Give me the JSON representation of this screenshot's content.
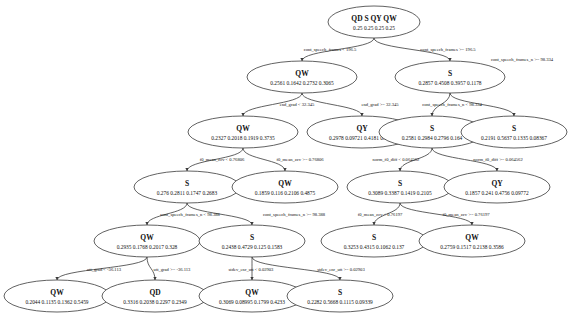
{
  "diagram": {
    "type": "decision-tree",
    "title": "",
    "node_shape": "ellipse",
    "class_order": [
      "QD",
      "S",
      "QY",
      "QW"
    ],
    "colors": {
      "stroke": "#3a3a3a",
      "fill": "#ffffff",
      "text": "#111111"
    },
    "nodes": [
      {
        "id": "n0",
        "label": "QD S QY QW",
        "values": "0.25 0.25 0.25 0.25",
        "cx": 374,
        "cy": 22,
        "rx": 46,
        "ry": 16
      },
      {
        "id": "n1",
        "label": "QW",
        "values": "0.2561 0.1642 0.2732 0.3065",
        "cx": 302,
        "cy": 77,
        "rx": 55,
        "ry": 16
      },
      {
        "id": "n2",
        "label": "S",
        "values": "0.2857 0.4508 0.3957 0.1178",
        "cx": 450,
        "cy": 77,
        "rx": 55,
        "ry": 16
      },
      {
        "id": "n3",
        "label": "QW",
        "values": "0.2327 0.2018 0.1919 0.3735",
        "cx": 243,
        "cy": 132,
        "rx": 55,
        "ry": 16
      },
      {
        "id": "n4",
        "label": "QY",
        "values": "0.2978 0.09721 0.4181 0.1869",
        "cx": 362,
        "cy": 132,
        "rx": 55,
        "ry": 16
      },
      {
        "id": "n5",
        "label": "S",
        "values": "0.2581 0.2984 0.2796 0.164",
        "cx": 432,
        "cy": 132,
        "rx": 53,
        "ry": 16
      },
      {
        "id": "n6",
        "label": "S",
        "values": "0.2191 0.5637 0.1335 0.08367",
        "cx": 514,
        "cy": 132,
        "rx": 53,
        "ry": 16
      },
      {
        "id": "n7",
        "label": "S",
        "values": "0.276 0.2811 0.1747 0.2683",
        "cx": 187,
        "cy": 187,
        "rx": 53,
        "ry": 16
      },
      {
        "id": "n8",
        "label": "QW",
        "values": "0.1859 0.116 0.2106 0.4875",
        "cx": 285,
        "cy": 187,
        "rx": 53,
        "ry": 16
      },
      {
        "id": "n9",
        "label": "S",
        "values": "0.3089 0.3387 0.1419 0.2105",
        "cx": 400,
        "cy": 187,
        "rx": 53,
        "ry": 16
      },
      {
        "id": "n10",
        "label": "QY",
        "values": "0.1857 0.241 0.4756 0.09772",
        "cx": 497,
        "cy": 187,
        "rx": 53,
        "ry": 16
      },
      {
        "id": "n11",
        "label": "QW",
        "values": "0.2935 0.1768 0.2017 0.328",
        "cx": 147,
        "cy": 241,
        "rx": 53,
        "ry": 16
      },
      {
        "id": "n12",
        "label": "S",
        "values": "0.2438 0.4729 0.125 0.1583",
        "cx": 252,
        "cy": 241,
        "rx": 53,
        "ry": 16
      },
      {
        "id": "n13",
        "label": "S",
        "values": "0.3253 0.4315 0.1062 0.137",
        "cx": 374,
        "cy": 241,
        "rx": 53,
        "ry": 16
      },
      {
        "id": "n14",
        "label": "QW",
        "values": "0.2759 0.1517 0.2138 0.3586",
        "cx": 472,
        "cy": 241,
        "rx": 53,
        "ry": 16
      },
      {
        "id": "n15",
        "label": "QW",
        "values": "0.2044 0.1135 0.1362 0.5459",
        "cx": 57,
        "cy": 296,
        "rx": 53,
        "ry": 16
      },
      {
        "id": "n16",
        "label": "QD",
        "values": "0.3316 0.2038 0.2297 0.2349",
        "cx": 155,
        "cy": 296,
        "rx": 53,
        "ry": 16
      },
      {
        "id": "n17",
        "label": "QW",
        "values": "0.3069 0.08995 0.1799 0.4233",
        "cx": 252,
        "cy": 296,
        "rx": 53,
        "ry": 16
      },
      {
        "id": "n18",
        "label": "S",
        "values": "0.2282 0.5668 0.1115 0.09339",
        "cx": 340,
        "cy": 296,
        "rx": 53,
        "ry": 16
      }
    ],
    "edges": [
      {
        "from": "n0",
        "to": "n1",
        "label": "cont_speech_frames < 196.5",
        "lx": 330,
        "ly": 51
      },
      {
        "from": "n0",
        "to": "n2",
        "label": "cont_speech_frames >= 196.5",
        "lx": 448,
        "ly": 51
      },
      {
        "from": "n1",
        "to": "n3",
        "label": "end_grad < 32.345",
        "lx": 297,
        "ly": 106
      },
      {
        "from": "n1",
        "to": "n4",
        "label": "end_grad >= 32.345",
        "lx": 380,
        "ly": 106
      },
      {
        "from": "n2",
        "to": "n5",
        "label": "cont_speech_frames_n < 98.334",
        "lx": 452,
        "ly": 106
      },
      {
        "from": "n2",
        "to": "n6",
        "label": "cont_speech_frames_n >= 98.334",
        "lx": 522,
        "ly": 61
      },
      {
        "from": "n3",
        "to": "n7",
        "label": "f0_mean_zcv < 0.76806",
        "lx": 222,
        "ly": 161
      },
      {
        "from": "n3",
        "to": "n8",
        "label": "f0_mean_zcv >= 0.76806",
        "lx": 300,
        "ly": 161
      },
      {
        "from": "n5",
        "to": "n9",
        "label": "norm_f0_diff < 0.064562",
        "lx": 396,
        "ly": 161
      },
      {
        "from": "n5",
        "to": "n10",
        "label": "norm_f0_diff >= 0.064562",
        "lx": 498,
        "ly": 161
      },
      {
        "from": "n7",
        "to": "n11",
        "label": "cont_speech_frames_n < 98.388",
        "lx": 190,
        "ly": 216
      },
      {
        "from": "n7",
        "to": "n12",
        "label": "cont_speech_frames_n >= 98.388",
        "lx": 294,
        "ly": 216
      },
      {
        "from": "n9",
        "to": "n13",
        "label": "f0_mean_zcv < 0.76197",
        "lx": 380,
        "ly": 216
      },
      {
        "from": "n9",
        "to": "n14",
        "label": "f0_mean_zcv >= 0.76197",
        "lx": 466,
        "ly": 216
      },
      {
        "from": "n11",
        "to": "n15",
        "label": "utt_grad < -36.113",
        "lx": 104,
        "ly": 271
      },
      {
        "from": "n11",
        "to": "n16",
        "label": "utt_grad >= -36.113",
        "lx": 172,
        "ly": 271
      },
      {
        "from": "n12",
        "to": "n17",
        "label": "stdev_enr_utt < 0.02903",
        "lx": 251,
        "ly": 271
      },
      {
        "from": "n12",
        "to": "n18",
        "label": "stdev_enr_utt >= 0.02903",
        "lx": 341,
        "ly": 271
      }
    ]
  }
}
